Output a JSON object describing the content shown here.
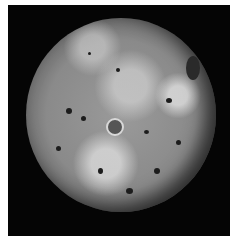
{
  "image": {
    "subject": "Io (moon of Jupiter)",
    "style": "grayscale photograph",
    "background_color": "#050505",
    "border_color": "#ffffff"
  }
}
